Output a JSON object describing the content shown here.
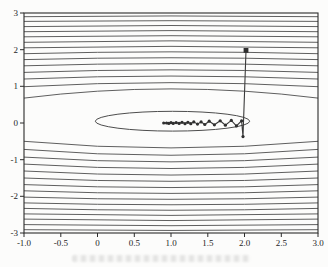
{
  "figure": {
    "kind": "scanned contour plot with steepest-descent optimization path",
    "background": "#fcfcfb",
    "contour_color": "#4d4d4d",
    "axis_color": "#2b2b2b",
    "path_color": "#3a3a3a",
    "marker_color": "#2f2f2f",
    "label_color": "#1e1e1e"
  },
  "chart_data": {
    "type": "line",
    "plot_kind": "contour-plot-with-descent-trajectory",
    "title": "",
    "xlabel": "",
    "ylabel": "",
    "grid": false,
    "legend": null,
    "xlim": [
      -1.0,
      3.0
    ],
    "ylim": [
      -3,
      3
    ],
    "x_ticks": [
      "-1.0",
      "-0.5",
      "0",
      "0.5",
      "1.0",
      "1.5",
      "2.0",
      "2.5",
      "3.0"
    ],
    "x_tick_values": [
      -1.0,
      -0.5,
      0,
      0.5,
      1.0,
      1.5,
      2.0,
      2.5,
      3.0
    ],
    "y_ticks": [
      "-3",
      "-2",
      "-1",
      "0",
      "1",
      "2",
      "3"
    ],
    "y_tick_values": [
      -3,
      -2,
      -1,
      0,
      1,
      2,
      3
    ],
    "contours": {
      "ellipse": {
        "cx": 1.02,
        "cy": 0.05,
        "rx": 1.05,
        "ry": 0.27
      },
      "top_arcs": [
        [
          0.93,
          0.68
        ],
        [
          1.1,
          0.99
        ],
        [
          1.28,
          1.2
        ],
        [
          1.45,
          1.38
        ],
        [
          1.62,
          1.56
        ],
        [
          1.78,
          1.73
        ],
        [
          1.94,
          1.89
        ],
        [
          2.09,
          2.05
        ],
        [
          2.24,
          2.2
        ],
        [
          2.38,
          2.35
        ],
        [
          2.52,
          2.49
        ],
        [
          2.66,
          2.63
        ],
        [
          2.79,
          2.77
        ],
        [
          2.92,
          2.9
        ]
      ],
      "bottom_arcs": [
        [
          -0.68,
          -0.5
        ],
        [
          -0.88,
          -0.72
        ],
        [
          -1.06,
          -0.93
        ],
        [
          -1.24,
          -1.12
        ],
        [
          -1.42,
          -1.31
        ],
        [
          -1.59,
          -1.5
        ],
        [
          -1.76,
          -1.68
        ],
        [
          -1.92,
          -1.85
        ],
        [
          -2.08,
          -2.02
        ],
        [
          -2.23,
          -2.18
        ],
        [
          -2.38,
          -2.33
        ],
        [
          -2.52,
          -2.48
        ],
        [
          -2.66,
          -2.62
        ],
        [
          -2.8,
          -2.77
        ],
        [
          -2.93,
          -2.91
        ]
      ]
    },
    "trajectory": {
      "start_marker": "filled-square",
      "point_marker": "dot",
      "start_point": [
        2.02,
        1.98
      ],
      "points": [
        [
          2.02,
          1.98
        ],
        [
          1.98,
          -0.37
        ],
        [
          1.96,
          0.06
        ],
        [
          1.89,
          -0.08
        ],
        [
          1.82,
          0.07
        ],
        [
          1.74,
          -0.06
        ],
        [
          1.67,
          0.06
        ],
        [
          1.59,
          -0.05
        ],
        [
          1.52,
          0.05
        ],
        [
          1.46,
          -0.04
        ],
        [
          1.41,
          0.03
        ],
        [
          1.36,
          -0.03
        ],
        [
          1.31,
          0.03
        ],
        [
          1.27,
          -0.02
        ],
        [
          1.23,
          0.02
        ],
        [
          1.19,
          -0.02
        ],
        [
          1.15,
          0.02
        ],
        [
          1.11,
          -0.01
        ],
        [
          1.07,
          0.01
        ],
        [
          1.03,
          -0.01
        ],
        [
          1.0,
          0.01
        ],
        [
          0.97,
          -0.01
        ],
        [
          0.94,
          0.0
        ],
        [
          0.9,
          0.0
        ]
      ]
    }
  }
}
